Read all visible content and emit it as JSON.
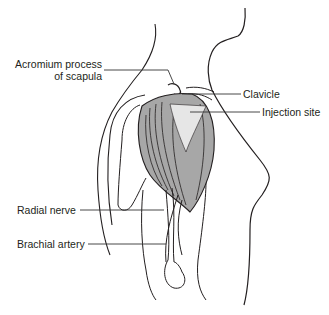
{
  "diagram": {
    "labels": {
      "acromium_line1": "Acromium process",
      "acromium_line2": "of scapula",
      "clavicle": "Clavicle",
      "injection_site": "Injection site",
      "radial_nerve": "Radial nerve",
      "brachial_artery": "Brachial artery"
    },
    "colors": {
      "outline": "#231f20",
      "muscle": "#a7a7a7",
      "injection_site": "#e6e6e6",
      "leader": "#333333"
    }
  }
}
